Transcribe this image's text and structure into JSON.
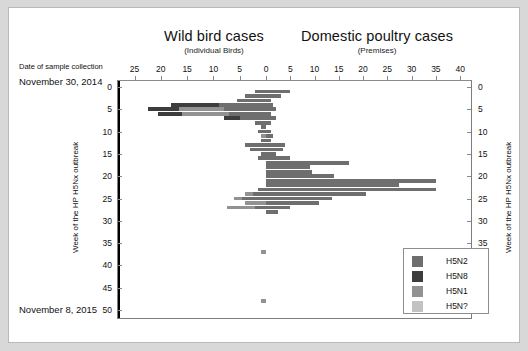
{
  "panels": {
    "left": {
      "title": "Wild bird cases",
      "subtitle": "(Individual Birds)"
    },
    "right": {
      "title": "Domestic poultry cases",
      "subtitle": "(Premises)"
    }
  },
  "date_axis": {
    "caption": "Date of sample collection",
    "start": "November 30, 2014",
    "end": "November 8, 2015"
  },
  "yaxis_title": "Week of the HP H5Nx outbreak",
  "legend": {
    "items": [
      {
        "label": "H5N2",
        "color": "#6e6e6e"
      },
      {
        "label": "H5N8",
        "color": "#3d3d3d"
      },
      {
        "label": "H5N1",
        "color": "#929292"
      },
      {
        "label": "H5N?",
        "color": "#c2c2c2"
      }
    ]
  },
  "chart_data": {
    "type": "bar",
    "orientation": "horizontal-diverging",
    "xlabel_left": "Wild bird cases (Individual Birds)",
    "xlabel_right": "Domestic poultry cases (Premises)",
    "ylabel": "Week of the HP H5Nx outbreak",
    "ylim": [
      0,
      50
    ],
    "ytick_labels": [
      0,
      5,
      10,
      15,
      20,
      25,
      30,
      35,
      40,
      45,
      50
    ],
    "left_axis": {
      "ticks": [
        25,
        20,
        15,
        10,
        5,
        0
      ],
      "max": 27,
      "direction": "left"
    },
    "right_axis": {
      "ticks": [
        0,
        5,
        10,
        15,
        20,
        25,
        30,
        35,
        40
      ],
      "max": 41,
      "direction": "right"
    },
    "grid": false,
    "legend_position": "bottom-right",
    "series_order": [
      "H5N2",
      "H5N8",
      "H5N1",
      "H5N?"
    ],
    "series_colors": {
      "H5N2": "#6e6e6e",
      "H5N8": "#3d3d3d",
      "H5N1": "#929292",
      "H5N?": "#c2c2c2"
    },
    "left_panel_stacked_bars": [
      {
        "week": 1,
        "segments": [
          {
            "type": "H5N2",
            "value": 2.0
          }
        ]
      },
      {
        "week": 2,
        "segments": [
          {
            "type": "H5N2",
            "value": 4.0
          }
        ]
      },
      {
        "week": 3,
        "segments": [
          {
            "type": "H5N2",
            "value": 5.5
          }
        ]
      },
      {
        "week": 4,
        "segments": [
          {
            "type": "H5N2",
            "value": 9.0
          },
          {
            "type": "H5N8",
            "value": 9.0
          }
        ]
      },
      {
        "week": 5,
        "segments": [
          {
            "type": "H5N2",
            "value": 8.0
          },
          {
            "type": "H5N1",
            "value": 8.5
          },
          {
            "type": "H5N8",
            "value": 6.0
          }
        ]
      },
      {
        "week": 6,
        "segments": [
          {
            "type": "H5N2",
            "value": 7.0
          },
          {
            "type": "H5N1",
            "value": 9.0
          },
          {
            "type": "H5N8",
            "value": 4.5
          }
        ]
      },
      {
        "week": 7,
        "segments": [
          {
            "type": "H5N2",
            "value": 5.0
          },
          {
            "type": "H5N8",
            "value": 3.0
          }
        ]
      },
      {
        "week": 8,
        "segments": [
          {
            "type": "H5N2",
            "value": 2.0
          }
        ]
      },
      {
        "week": 9,
        "segments": [
          {
            "type": "H5N2",
            "value": 1.0
          }
        ]
      },
      {
        "week": 10,
        "segments": [
          {
            "type": "H5N2",
            "value": 1.5
          }
        ]
      },
      {
        "week": 11,
        "segments": [
          {
            "type": "H5N1",
            "value": 1.0
          }
        ]
      },
      {
        "week": 12,
        "segments": [
          {
            "type": "H5N2",
            "value": 1.0
          }
        ]
      },
      {
        "week": 13,
        "segments": [
          {
            "type": "H5N2",
            "value": 4.0
          }
        ]
      },
      {
        "week": 14,
        "segments": [
          {
            "type": "H5N2",
            "value": 3.0
          }
        ]
      },
      {
        "week": 15,
        "segments": [
          {
            "type": "H5N2",
            "value": 1.0
          }
        ]
      },
      {
        "week": 16,
        "segments": [
          {
            "type": "H5N2",
            "value": 1.5
          }
        ]
      },
      {
        "week": 23,
        "segments": [
          {
            "type": "H5N2",
            "value": 1.5
          }
        ]
      },
      {
        "week": 24,
        "segments": [
          {
            "type": "H5N2",
            "value": 2.5
          },
          {
            "type": "H5N1",
            "value": 1.5
          }
        ]
      },
      {
        "week": 25,
        "segments": [
          {
            "type": "H5N2",
            "value": 4.5
          },
          {
            "type": "H5N1",
            "value": 1.5
          }
        ]
      },
      {
        "week": 26,
        "segments": [
          {
            "type": "H5N1",
            "value": 4.0
          }
        ]
      },
      {
        "week": 27,
        "segments": [
          {
            "type": "H5N2",
            "value": 2.0
          },
          {
            "type": "H5N1",
            "value": 5.5
          }
        ]
      },
      {
        "week": 37,
        "segments": [
          {
            "type": "H5N1",
            "value": 1.0
          }
        ]
      },
      {
        "week": 48,
        "segments": [
          {
            "type": "H5N1",
            "value": 1.0
          }
        ]
      }
    ],
    "right_panel_stacked_bars": [
      {
        "week": 1,
        "segments": [
          {
            "type": "H5N2",
            "value": 5.0
          }
        ]
      },
      {
        "week": 2,
        "segments": [
          {
            "type": "H5N2",
            "value": 3.0
          }
        ]
      },
      {
        "week": 3,
        "segments": [
          {
            "type": "H5N2",
            "value": 1.0
          }
        ]
      },
      {
        "week": 4,
        "segments": [
          {
            "type": "H5N2",
            "value": 1.5
          }
        ]
      },
      {
        "week": 5,
        "segments": [
          {
            "type": "H5N2",
            "value": 2.0
          }
        ]
      },
      {
        "week": 6,
        "segments": [
          {
            "type": "H5N2",
            "value": 1.0
          }
        ]
      },
      {
        "week": 7,
        "segments": [
          {
            "type": "H5N2",
            "value": 2.0
          }
        ]
      },
      {
        "week": 8,
        "segments": [
          {
            "type": "H5N2",
            "value": 1.0
          }
        ]
      },
      {
        "week": 10,
        "segments": [
          {
            "type": "H5N2",
            "value": 1.0
          }
        ]
      },
      {
        "week": 11,
        "segments": [
          {
            "type": "H5N2",
            "value": 1.5
          }
        ]
      },
      {
        "week": 12,
        "segments": [
          {
            "type": "H5N2",
            "value": 1.0
          }
        ]
      },
      {
        "week": 13,
        "segments": [
          {
            "type": "H5N2",
            "value": 4.0
          }
        ]
      },
      {
        "week": 14,
        "segments": [
          {
            "type": "H5N2",
            "value": 3.5
          }
        ]
      },
      {
        "week": 15,
        "segments": [
          {
            "type": "H5N2",
            "value": 2.0
          }
        ]
      },
      {
        "week": 16,
        "segments": [
          {
            "type": "H5N2",
            "value": 5.0
          }
        ]
      },
      {
        "week": 17,
        "segments": [
          {
            "type": "H5N2",
            "value": 17.0
          }
        ]
      },
      {
        "week": 18,
        "segments": [
          {
            "type": "H5N2",
            "value": 9.0
          }
        ]
      },
      {
        "week": 19,
        "segments": [
          {
            "type": "H5N2",
            "value": 9.5
          }
        ]
      },
      {
        "week": 20,
        "segments": [
          {
            "type": "H5N2",
            "value": 14.0
          }
        ]
      },
      {
        "week": 21,
        "segments": [
          {
            "type": "H5N2",
            "value": 35.0
          }
        ]
      },
      {
        "week": 22,
        "segments": [
          {
            "type": "H5N2",
            "value": 27.5
          }
        ]
      },
      {
        "week": 23,
        "segments": [
          {
            "type": "H5N2",
            "value": 35.0
          }
        ]
      },
      {
        "week": 24,
        "segments": [
          {
            "type": "H5N2",
            "value": 20.5
          }
        ]
      },
      {
        "week": 25,
        "segments": [
          {
            "type": "H5N2",
            "value": 13.5
          }
        ]
      },
      {
        "week": 26,
        "segments": [
          {
            "type": "H5N2",
            "value": 11.0
          }
        ]
      },
      {
        "week": 27,
        "segments": [
          {
            "type": "H5N2",
            "value": 5.0
          }
        ]
      },
      {
        "week": 28,
        "segments": [
          {
            "type": "H5N2",
            "value": 2.5
          }
        ]
      }
    ]
  }
}
